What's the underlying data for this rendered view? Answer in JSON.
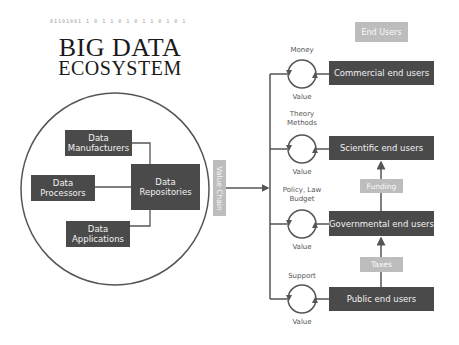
{
  "title": {
    "line1": "BIG DATA",
    "line2": "ECOSYSTEM",
    "decor_digits": "01101001 1 0 1 1 0 1 0 1 1 0  1   0    1"
  },
  "ecosystem": {
    "nodes": {
      "manufacturers": [
        "Data",
        "Manufacturers"
      ],
      "processors": [
        "Data",
        "Processors"
      ],
      "repositories": [
        "Data",
        "Repositories"
      ],
      "applications": [
        "Data",
        "Applications"
      ]
    }
  },
  "value_chain_label": "Value Chain",
  "end_users_header": "End Users",
  "end_users": [
    {
      "label": "Commercial end users",
      "exchange_top": "Money",
      "exchange_bottom": "Value"
    },
    {
      "label": "Scientific end users",
      "exchange_top": "Theory\nMethods",
      "exchange_top_lines": [
        "Theory",
        "Methods"
      ],
      "exchange_bottom": "Value"
    },
    {
      "label": "Governmental end users",
      "exchange_top_lines": [
        "Policy, Law",
        "Budget"
      ],
      "exchange_bottom": "Value"
    },
    {
      "label": "Public end users",
      "exchange_top": "Support",
      "exchange_bottom": "Value"
    }
  ],
  "flows": {
    "funding": "Funding",
    "taxes": "Taxes"
  },
  "colors": {
    "dark_box": "#4a4a4a",
    "light_box": "#bdbdbd",
    "line": "#555555"
  }
}
